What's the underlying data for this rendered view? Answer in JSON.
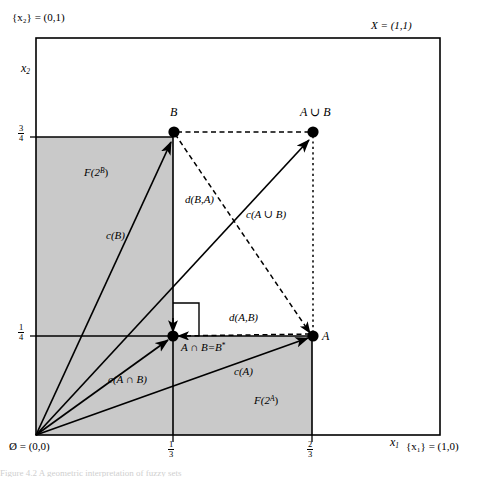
{
  "figure": {
    "type": "diagram",
    "colors": {
      "line": "#000000",
      "shade": "#c9c9c9",
      "background": "#ffffff"
    },
    "square": {
      "corner_labels": {
        "top_left": "{x₂} = (0,1)",
        "top_right": "X = (1,1)",
        "bottom_left": "Ø = (0,0)",
        "bottom_right": "{x₁} = (1,0)"
      }
    },
    "axes": {
      "x_label": "x₁",
      "y_label": "x₂",
      "x_ticks": [
        {
          "value": "1/3",
          "num": "1",
          "den": "3"
        },
        {
          "value": "2/3",
          "num": "2",
          "den": "3"
        }
      ],
      "y_ticks": [
        {
          "value": "3/4",
          "num": "3",
          "den": "4"
        },
        {
          "value": "1/4",
          "num": "1",
          "den": "4"
        }
      ]
    },
    "points": [
      {
        "name": "B",
        "label": "B",
        "x": "1/3",
        "y": "3/4"
      },
      {
        "name": "A-union-B",
        "label": "A ∪ B",
        "x": "2/3",
        "y": "3/4"
      },
      {
        "name": "A",
        "label": "A",
        "x": "2/3",
        "y": "1/4"
      },
      {
        "name": "A-inter-B",
        "label": "A ∩ B=B",
        "label_sup": "*",
        "x": "1/3",
        "y": "1/4"
      }
    ],
    "regions": [
      {
        "name": "F-2-B",
        "label": "F(2",
        "label_sup": "B",
        "label_end": ")",
        "x_range": "0 to 1/3",
        "y_range": "0 to 3/4"
      },
      {
        "name": "F-2-A",
        "label": "F(2",
        "label_sup": "A",
        "label_end": ")",
        "x_range": "0 to 2/3",
        "y_range": "0 to 1/4"
      }
    ],
    "vectors": [
      {
        "name": "c-B",
        "label": "c(B)",
        "from": "origin",
        "to": "B"
      },
      {
        "name": "c-A",
        "label": "c(A)",
        "from": "origin",
        "to": "A"
      },
      {
        "name": "c-A-inter-B",
        "label": "c(A ∩ B)",
        "from": "origin",
        "to": "A-inter-B"
      },
      {
        "name": "c-A-union-B",
        "label": "c(A ∪ B)",
        "from": "origin",
        "to": "A-union-B"
      }
    ],
    "distances": [
      {
        "name": "d-B-A",
        "label": "d(B,A)",
        "from": "B",
        "to": "A",
        "style": "dashed"
      },
      {
        "name": "d-A-B",
        "label": "d(A,B)",
        "from": "A",
        "to": "A-inter-B",
        "style": "dashed"
      }
    ],
    "connectors": [
      {
        "name": "B-to-union",
        "style": "dashed",
        "from": "B",
        "to": "A-union-B"
      },
      {
        "name": "union-to-A",
        "style": "dotted",
        "from": "A-union-B",
        "to": "A"
      }
    ],
    "right_angle_marker": {
      "name": "right-angle-mark",
      "at": "A-inter-B"
    }
  },
  "caption": {
    "text": "Figure 4.2 A geometric interpretation of fuzzy sets"
  }
}
